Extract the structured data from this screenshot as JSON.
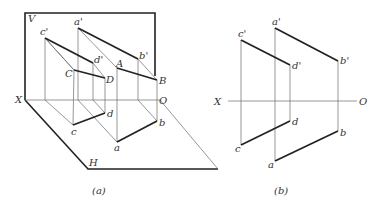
{
  "figure_a": {
    "caption": "(a)",
    "labels": {
      "V": "V",
      "H": "H",
      "X": "X",
      "O": "O",
      "a_prime": "a'",
      "b_prime": "b'",
      "c_prime": "c'",
      "d_prime": "d'",
      "A": "A",
      "B": "B",
      "C": "C",
      "D": "D",
      "a": "a",
      "b": "b",
      "c": "c",
      "d": "d"
    }
  },
  "figure_b": {
    "caption": "(b)",
    "labels": {
      "X": "X",
      "O": "O",
      "a_prime": "a'",
      "b_prime": "b'",
      "c_prime": "c'",
      "d_prime": "d'",
      "a": "a",
      "b": "b",
      "c": "c",
      "d": "d"
    }
  }
}
